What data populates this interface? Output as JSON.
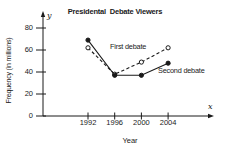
{
  "chart_data": {
    "type": "line",
    "title": "Presidental  Debate Viewers",
    "xlabel": "Year",
    "ylabel": "Frequency (in millions)",
    "x_axis_letter": "x",
    "y_axis_letter": "y",
    "categories": [
      "1992",
      "1996",
      "2000",
      "2004"
    ],
    "y_ticks": [
      "0",
      "20",
      "40",
      "60",
      "80"
    ],
    "ylim": [
      0,
      88
    ],
    "grid": false,
    "legend_position": "inline-labels",
    "series": [
      {
        "name": "First debate",
        "values": [
          62,
          38,
          49,
          62
        ],
        "line_style": "dashed",
        "marker": "open-circle"
      },
      {
        "name": "Second debate",
        "values": [
          69,
          37,
          37,
          48
        ],
        "line_style": "solid",
        "marker": "filled-circle"
      }
    ],
    "colors": {
      "line": "#1a1a1a",
      "text": "#1a1a1a",
      "background": "#ffffff",
      "open_marker_fill": "#ffffff"
    }
  }
}
